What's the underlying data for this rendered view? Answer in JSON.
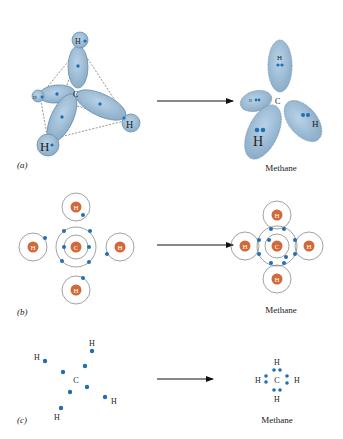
{
  "colors": {
    "orbital_fill": "#9cbfdc",
    "orbital_stroke": "#6f8fa8",
    "electron": "#1f6fb5",
    "nucleus": "#d2693a",
    "orbit_line": "#7a7a7a",
    "text": "#222222"
  },
  "panels": [
    {
      "id": "a",
      "label": "(a)",
      "product_label": "Methane"
    },
    {
      "id": "b",
      "label": "(b)",
      "product_label": "Methane"
    },
    {
      "id": "c",
      "label": "(c)",
      "product_label": "Methane"
    }
  ],
  "atoms": {
    "carbon": "C",
    "hydrogen": "H"
  }
}
